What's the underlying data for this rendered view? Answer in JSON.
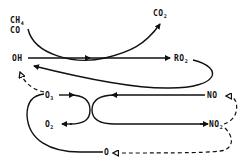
{
  "diagram": {
    "type": "chemical reaction cycle",
    "nodes": {
      "ch4": {
        "text": "CH",
        "sub": "4"
      },
      "co": {
        "text": "CO"
      },
      "co2": {
        "text": "CO",
        "sub": "2"
      },
      "oh": {
        "text": "OH"
      },
      "ro2": {
        "text": "RO",
        "sub": "2"
      },
      "o3": {
        "text": "O",
        "sub": "3"
      },
      "o2": {
        "text": "O",
        "sub": "2"
      },
      "no": {
        "text": "NO"
      },
      "no2": {
        "text": "NO",
        "sub": "2"
      },
      "o": {
        "text": "O"
      }
    },
    "edges": [
      {
        "from": "CH4/CO",
        "to": "CO2",
        "style": "solid"
      },
      {
        "from": "OH",
        "to": "RO2",
        "style": "solid"
      },
      {
        "from": "RO2",
        "to": "OH",
        "style": "solid"
      },
      {
        "from": "O3",
        "to": "OH",
        "style": "dashed"
      },
      {
        "from": "NO",
        "to": "O3 junction",
        "style": "solid"
      },
      {
        "from": "O3",
        "to": "O2",
        "style": "solid"
      },
      {
        "from": "junction",
        "to": "NO2",
        "style": "solid"
      },
      {
        "from": "NO2",
        "to": "NO",
        "style": "dashed"
      },
      {
        "from": "NO2",
        "to": "O",
        "style": "dashed"
      },
      {
        "from": "O",
        "to": "O3",
        "style": "solid"
      }
    ],
    "colors": {
      "line": "#111111",
      "background": "#ffffff"
    }
  }
}
